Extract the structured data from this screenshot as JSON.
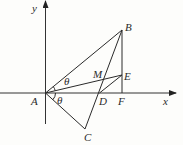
{
  "diagram": {
    "type": "geometry-coordinate-figure",
    "axes": {
      "x_label": "x",
      "y_label": "y"
    },
    "points": {
      "A": {
        "label": "A",
        "x": 45.5,
        "y": 93
      },
      "B": {
        "label": "B",
        "x": 122,
        "y": 30
      },
      "C": {
        "label": "C",
        "x": 85,
        "y": 129
      },
      "D": {
        "label": "D",
        "x": 99.5,
        "y": 93
      },
      "E": {
        "label": "E",
        "x": 122,
        "y": 75
      },
      "F": {
        "label": "F",
        "x": 122,
        "y": 93
      },
      "M": {
        "label": "M",
        "x": 105.5,
        "y": 79
      }
    },
    "segments": [
      "AB",
      "AE",
      "AC",
      "BC",
      "BF",
      "DE"
    ],
    "angles": [
      {
        "label": "θ",
        "between": "AB-AE"
      },
      {
        "label": "θ",
        "between": "AD-AC"
      }
    ],
    "colors": {
      "line": "#2a2a2a",
      "background": "#fdfdfb"
    }
  }
}
